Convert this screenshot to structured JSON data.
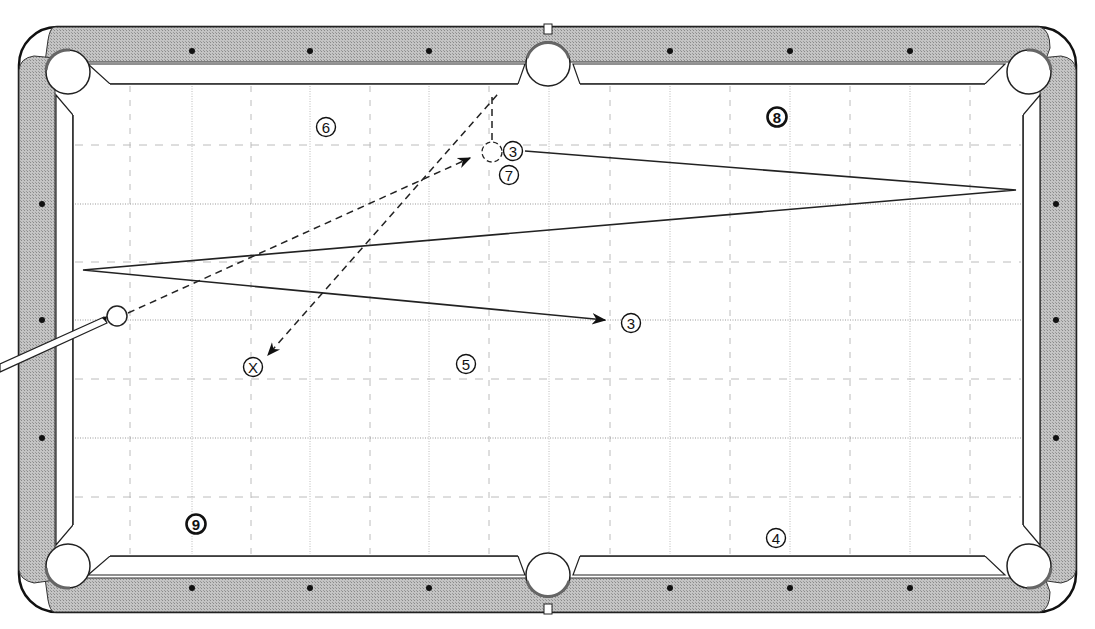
{
  "diagram": {
    "type": "billiards-shot-diagram",
    "table": {
      "felt_color": "#ffffff",
      "rail_color": "#b8b8b8",
      "outline_color": "#111111",
      "grid_color": "#bcbcbc",
      "diamonds_top_x": [
        192,
        310,
        429,
        670,
        790,
        910
      ],
      "diamonds_side_y": [
        204,
        320,
        438
      ],
      "grid_x": [
        130,
        192,
        251,
        310,
        370,
        429,
        489,
        549,
        610,
        670,
        730,
        790,
        850,
        910,
        970
      ],
      "grid_y": [
        145,
        204,
        262,
        320,
        379,
        438,
        497
      ]
    },
    "cue_ball": {
      "x": 117,
      "y": 316,
      "label": ""
    },
    "balls": [
      {
        "id": "ball-6",
        "label": "6",
        "x": 326,
        "y": 127,
        "style": "plain"
      },
      {
        "id": "ball-3-start",
        "label": "3",
        "x": 513,
        "y": 151,
        "style": "plain"
      },
      {
        "id": "ball-7",
        "label": "7",
        "x": 509,
        "y": 175,
        "style": "plain"
      },
      {
        "id": "ball-8",
        "label": "8",
        "x": 777,
        "y": 117,
        "style": "bold"
      },
      {
        "id": "ball-3-end",
        "label": "3",
        "x": 631,
        "y": 323,
        "style": "plain"
      },
      {
        "id": "ball-5",
        "label": "5",
        "x": 466,
        "y": 364,
        "style": "plain"
      },
      {
        "id": "ball-x",
        "label": "X",
        "x": 253,
        "y": 367,
        "style": "plain"
      },
      {
        "id": "ball-9",
        "label": "9",
        "x": 196,
        "y": 524,
        "style": "bold"
      },
      {
        "id": "ball-4",
        "label": "4",
        "x": 776,
        "y": 538,
        "style": "plain"
      }
    ],
    "ghost_ball": {
      "x": 492,
      "y": 152
    },
    "paths": {
      "object_ball_path": "M 525 151 L 1016 190 L 83 270 L 605 320",
      "cue_ball_to_ghost": "M 128 313 L 470 158",
      "cue_ball_after": "M 492 140 L 492 97 L 497 95 L 268 355"
    }
  }
}
